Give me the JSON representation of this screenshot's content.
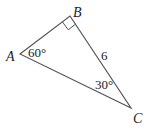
{
  "figure": {
    "vertices": {
      "A": {
        "label": "A",
        "x": 20,
        "y": 54
      },
      "B": {
        "label": "B",
        "x": 70,
        "y": 16
      },
      "C": {
        "label": "C",
        "x": 131,
        "y": 108
      }
    },
    "angles": {
      "A": "60°",
      "C": "30°",
      "B": "right-angle"
    },
    "side_BC": "6",
    "stroke_color": "#555555",
    "text_color": "#222222"
  }
}
